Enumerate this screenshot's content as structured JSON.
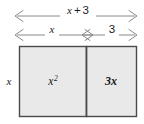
{
  "diagram": {
    "type": "area-model-rectangle",
    "title": "",
    "colors": {
      "cell_fill": "#e9e9e9",
      "border": "#4a4a4a",
      "divider": "#4a4a4a",
      "arrow": "#8a8a8a",
      "text": "#1a1a1a",
      "background": "#ffffff"
    },
    "dimension_arrows": [
      {
        "name": "total-width",
        "label": "x + 3",
        "label_parts": {
          "variable": "x",
          "operator": "+",
          "number": "3"
        },
        "position": "top",
        "span": "full"
      },
      {
        "name": "left-width",
        "label": "x",
        "position": "second-row",
        "span": "left-cell"
      },
      {
        "name": "right-width",
        "label": "3",
        "position": "second-row",
        "span": "right-cell"
      },
      {
        "name": "height",
        "label": "x",
        "position": "left",
        "span": "full-height"
      }
    ],
    "cells": [
      {
        "name": "left-cell",
        "label": "x2",
        "base": "x",
        "exponent": "2",
        "display": "x²"
      },
      {
        "name": "right-cell",
        "label": "3x",
        "coefficient": "3",
        "variable": "x",
        "display": "3x"
      }
    ]
  }
}
